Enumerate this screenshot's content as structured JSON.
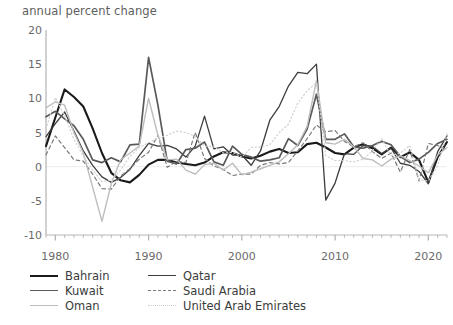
{
  "header": {
    "axis_note": "annual percent change"
  },
  "footnote": {
    "text": ""
  },
  "legend": {
    "entries": [
      {
        "name": "Bahrain",
        "color": "#1a1a1a",
        "width": 2.1,
        "dash": "none",
        "key": "bahrain"
      },
      {
        "name": "Qatar",
        "color": "#3d3d3d",
        "width": 1.3,
        "dash": "none",
        "key": "qatar"
      },
      {
        "name": "Kuwait",
        "color": "#595959",
        "width": 1.7,
        "dash": "none",
        "key": "kuwait"
      },
      {
        "name": "Saudi Arabia",
        "color": "#7a7a7a",
        "width": 1.2,
        "dash": "dashed",
        "key": "saudi_arabia"
      },
      {
        "name": "Oman",
        "color": "#bdbdbd",
        "width": 1.4,
        "dash": "none",
        "key": "oman"
      },
      {
        "name": "United Arab Emirates",
        "color": "#d0d0d0",
        "width": 1.2,
        "dash": "dotted",
        "key": "united_arab_emirates"
      }
    ]
  },
  "chart_data": {
    "type": "line",
    "title": "",
    "subtitle": "",
    "xlabel": "",
    "ylabel": "annual percent change",
    "xlim": [
      1979,
      2022
    ],
    "ylim": [
      -10,
      20
    ],
    "yticks": [
      20,
      15,
      10,
      5,
      0,
      -5,
      -10
    ],
    "xticks": [
      1980,
      1990,
      2000,
      2010,
      2020
    ],
    "minor_xtick_interval": 1,
    "grid": false,
    "zero_line": true,
    "legend_position": "below-left",
    "x": [
      1979,
      1980,
      1981,
      1982,
      1983,
      1984,
      1985,
      1986,
      1987,
      1988,
      1989,
      1990,
      1991,
      1992,
      1993,
      1994,
      1995,
      1996,
      1997,
      1998,
      1999,
      2000,
      2001,
      2002,
      2003,
      2004,
      2005,
      2006,
      2007,
      2008,
      2009,
      2010,
      2011,
      2012,
      2013,
      2014,
      2015,
      2016,
      2017,
      2018,
      2019,
      2020,
      2021,
      2022
    ],
    "series": [
      {
        "name": "Bahrain",
        "color": "#1a1a1a",
        "width": 2.1,
        "dash": "none",
        "values": [
          3.0,
          7.2,
          11.3,
          10.2,
          8.8,
          5.6,
          2.0,
          -0.9,
          -2.0,
          -2.3,
          -1.2,
          0.3,
          1.0,
          1.0,
          0.6,
          0.4,
          0.2,
          0.6,
          1.5,
          2.1,
          2.0,
          1.5,
          1.2,
          1.6,
          2.2,
          2.6,
          2.0,
          2.1,
          3.3,
          3.5,
          2.8,
          2.0,
          1.8,
          2.8,
          3.3,
          2.7,
          1.8,
          2.8,
          1.4,
          2.1,
          1.0,
          -2.3,
          1.4,
          3.6
        ]
      },
      {
        "name": "Qatar",
        "color": "#3d3d3d",
        "width": 1.3,
        "dash": "none",
        "values": [
          4.4,
          6.3,
          8.0,
          5.2,
          2.3,
          0.2,
          -1.5,
          -2.3,
          -1.6,
          -0.4,
          1.6,
          3.4,
          3.0,
          3.1,
          2.6,
          1.4,
          3.0,
          7.4,
          2.6,
          2.9,
          1.7,
          1.7,
          0.2,
          2.3,
          6.8,
          8.8,
          11.8,
          13.8,
          13.6,
          15.0,
          -4.9,
          -2.4,
          1.9,
          1.8,
          3.1,
          3.0,
          1.9,
          2.7,
          0.5,
          0.2,
          -0.7,
          -2.5,
          2.2,
          4.5
        ]
      },
      {
        "name": "Kuwait",
        "color": "#595959",
        "width": 1.7,
        "dash": "none",
        "values": [
          7.3,
          8.1,
          7.0,
          6.0,
          4.0,
          1.0,
          0.6,
          1.3,
          0.7,
          3.2,
          3.3,
          16.0,
          9.0,
          0.8,
          0.4,
          2.5,
          2.7,
          3.6,
          0.7,
          0.2,
          3.0,
          1.8,
          1.4,
          0.8,
          1.0,
          1.3,
          4.1,
          3.1,
          5.5,
          10.6,
          4.0,
          4.0,
          4.8,
          2.9,
          2.7,
          3.1,
          3.7,
          3.2,
          1.5,
          0.6,
          1.1,
          2.1,
          3.4,
          4.0
        ]
      },
      {
        "name": "Saudi Arabia",
        "color": "#7a7a7a",
        "width": 1.2,
        "dash": "dashed",
        "values": [
          1.7,
          4.5,
          2.8,
          1.0,
          0.8,
          -1.1,
          -3.2,
          -3.3,
          -1.4,
          -0.3,
          1.1,
          2.1,
          4.6,
          -0.1,
          0.8,
          0.6,
          5.0,
          1.2,
          0.1,
          -0.4,
          -1.3,
          -1.1,
          -1.1,
          0.2,
          0.6,
          0.4,
          0.6,
          2.3,
          4.1,
          6.1,
          5.1,
          5.3,
          3.7,
          2.9,
          3.5,
          2.2,
          1.2,
          2.0,
          -0.8,
          2.5,
          -2.1,
          3.4,
          3.1,
          2.5
        ]
      },
      {
        "name": "Oman",
        "color": "#bdbdbd",
        "width": 1.4,
        "dash": "none",
        "values": [
          8.6,
          9.5,
          9.0,
          5.0,
          2.0,
          -3.0,
          -8.0,
          -2.5,
          1.0,
          2.0,
          3.0,
          10.0,
          4.6,
          1.0,
          1.1,
          -0.5,
          -1.1,
          0.3,
          0.5,
          -0.5,
          0.5,
          -1.2,
          -0.8,
          -0.3,
          0.2,
          0.7,
          1.9,
          3.2,
          5.9,
          12.6,
          3.5,
          3.3,
          4.0,
          2.9,
          1.2,
          1.0,
          0.1,
          1.1,
          1.6,
          0.9,
          0.1,
          -0.9,
          1.7,
          2.8
        ]
      },
      {
        "name": "United Arab Emirates",
        "color": "#d0d0d0",
        "width": 1.2,
        "dash": "dotted",
        "values": [
          5.5,
          10.1,
          7.5,
          4.0,
          1.5,
          -0.5,
          -2.2,
          -2.0,
          -0.5,
          1.5,
          2.8,
          3.5,
          4.2,
          4.6,
          5.2,
          5.0,
          4.4,
          3.0,
          2.9,
          2.0,
          2.1,
          1.4,
          2.8,
          2.9,
          3.2,
          5.0,
          6.2,
          9.3,
          11.1,
          12.3,
          1.6,
          0.9,
          0.9,
          0.7,
          1.1,
          2.3,
          4.1,
          1.6,
          2.0,
          3.1,
          -1.9,
          -2.1,
          0.2,
          4.8
        ]
      }
    ]
  }
}
